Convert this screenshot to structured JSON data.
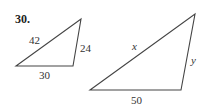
{
  "problem": {
    "number": "30."
  },
  "figures": [
    {
      "name": "small-triangle",
      "vertices": [
        [
          16,
          66
        ],
        [
          73,
          66
        ],
        [
          81,
          19
        ]
      ],
      "sides": {
        "hypotenuse": "42",
        "right": "24",
        "base": "30"
      }
    },
    {
      "name": "large-triangle",
      "vertices": [
        [
          90,
          90
        ],
        [
          181,
          90
        ],
        [
          195,
          14
        ]
      ],
      "sides": {
        "hypotenuse": "x",
        "right": "y",
        "base": "50"
      }
    }
  ]
}
